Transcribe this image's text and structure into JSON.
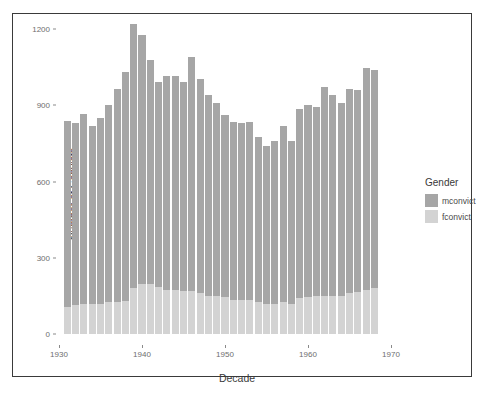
{
  "chart_data": {
    "type": "bar",
    "title": "",
    "subtitle": "",
    "xlabel": "Decade",
    "ylabel": "Number of Convicts",
    "xlim": [
      1930,
      1970
    ],
    "ylim": [
      0,
      1200
    ],
    "x_ticks": [
      1930,
      1940,
      1950,
      1960,
      1970
    ],
    "y_ticks": [
      0,
      300,
      600,
      900,
      1200
    ],
    "grid": false,
    "stacked": true,
    "legend_title": "Gender",
    "legend_position": "right",
    "legend": [
      "mconvict",
      "fconvict"
    ],
    "colors": {
      "mconvict": "#a6a6a6",
      "fconvict": "#d3d3d3",
      "axis_text": "#6e6e6e",
      "title_text": "#3a3a3a",
      "frame": "#3a3a3a",
      "background": "#ffffff"
    },
    "x": [
      1931,
      1932,
      1933,
      1934,
      1935,
      1936,
      1937,
      1938,
      1939,
      1940,
      1941,
      1942,
      1943,
      1944,
      1945,
      1946,
      1947,
      1948,
      1949,
      1950,
      1951,
      1952,
      1953,
      1954,
      1955,
      1956,
      1957,
      1958,
      1959,
      1960,
      1961,
      1962,
      1963,
      1964,
      1965,
      1966,
      1967,
      1968
    ],
    "series": [
      {
        "name": "mconvict",
        "values": [
          735,
          715,
          745,
          700,
          730,
          775,
          840,
          900,
          1040,
          980,
          885,
          805,
          840,
          840,
          820,
          920,
          845,
          790,
          760,
          715,
          700,
          695,
          700,
          650,
          620,
          640,
          695,
          640,
          745,
          755,
          745,
          820,
          790,
          760,
          805,
          795,
          870,
          860
        ]
      },
      {
        "name": "fconvict",
        "values": [
          105,
          115,
          120,
          120,
          120,
          125,
          125,
          130,
          180,
          195,
          195,
          185,
          175,
          175,
          170,
          170,
          160,
          150,
          150,
          145,
          135,
          135,
          135,
          125,
          120,
          120,
          125,
          120,
          140,
          145,
          150,
          150,
          150,
          150,
          160,
          165,
          175,
          180
        ]
      }
    ],
    "totals": [
      840,
      830,
      865,
      820,
      850,
      900,
      965,
      1030,
      1160,
      1110,
      1020,
      935,
      960,
      960,
      955,
      1035,
      960,
      905,
      875,
      830,
      805,
      800,
      790,
      775,
      740,
      700,
      760,
      775,
      830,
      840,
      895,
      880,
      865,
      880,
      900,
      890,
      910,
      965
    ]
  },
  "legend": {
    "title": "Gender",
    "items": [
      {
        "label": "mconvict",
        "color": "#a6a6a6"
      },
      {
        "label": "fconvict",
        "color": "#d3d3d3"
      }
    ]
  },
  "axes": {
    "y_title": "Number of Convicts",
    "x_title": "Decade",
    "y_tick_labels": [
      "1200",
      "900",
      "600",
      "300",
      "0"
    ],
    "x_tick_labels": [
      "1930",
      "1940",
      "1950",
      "1960",
      "1970"
    ]
  }
}
